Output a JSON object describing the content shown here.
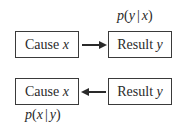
{
  "diagram": {
    "top": {
      "cause": {
        "word": "Cause",
        "var": "x"
      },
      "result": {
        "word": "Result",
        "var": "y"
      },
      "arrow_direction": "cause-to-result",
      "label": {
        "p": "p",
        "open": "(",
        "a": "y",
        "bar": "|",
        "b": "x",
        "close": ")"
      }
    },
    "bottom": {
      "cause": {
        "word": "Cause",
        "var": "x"
      },
      "result": {
        "word": "Result",
        "var": "y"
      },
      "arrow_direction": "result-to-cause",
      "label": {
        "p": "p",
        "open": "(",
        "a": "x",
        "bar": "|",
        "b": "y",
        "close": ")"
      }
    },
    "colors": {
      "stroke": "#3a3a3a",
      "text": "#2a2a2a",
      "background": "#ffffff"
    }
  }
}
